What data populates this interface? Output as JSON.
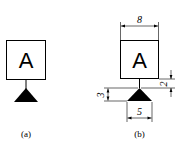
{
  "figures": [
    {
      "id": "a",
      "caption": "(a)",
      "symbol_letter": "A"
    },
    {
      "id": "b",
      "caption": "(b)",
      "symbol_letter": "A",
      "dimensions": {
        "box_width": "8",
        "stem_height": "2",
        "triangle_height": "3",
        "triangle_base": "5"
      }
    }
  ]
}
